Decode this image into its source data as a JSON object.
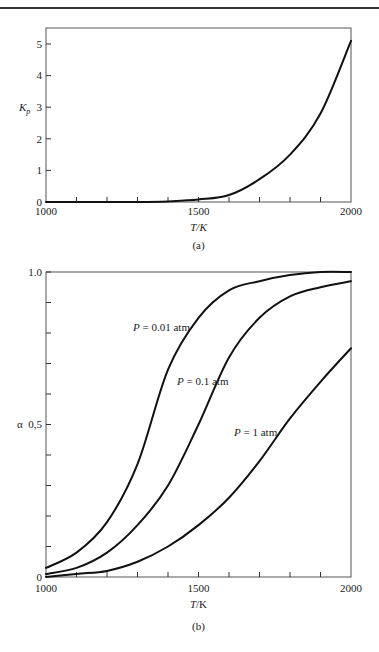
{
  "chart_data": [
    {
      "type": "line",
      "panel": "(a)",
      "title": "",
      "xlabel": "T/K",
      "ylabel": "Kp",
      "xlim": [
        1000,
        2000
      ],
      "ylim": [
        0,
        5.4
      ],
      "x_ticks": [
        1000,
        1100,
        1200,
        1300,
        1400,
        1500,
        1600,
        1700,
        1800,
        1900,
        2000
      ],
      "x_tick_labels": [
        "1000",
        "1500",
        "2000"
      ],
      "y_ticks": [
        0,
        1,
        2,
        3,
        4,
        5
      ],
      "y_tick_labels": [
        "0",
        "1",
        "2",
        "3",
        "4",
        "5"
      ],
      "grid": false,
      "legend": null,
      "x": [
        1000,
        1100,
        1200,
        1300,
        1400,
        1500,
        1600,
        1700,
        1800,
        1900,
        2000
      ],
      "series": [
        {
          "name": "Kp",
          "values": [
            0.0,
            0.0,
            0.0,
            0.0,
            0.02,
            0.08,
            0.22,
            0.72,
            1.5,
            2.8,
            5.1
          ]
        }
      ]
    },
    {
      "type": "line",
      "panel": "(b)",
      "title": "",
      "xlabel": "T/K",
      "ylabel": "α",
      "xlim": [
        1000,
        2000
      ],
      "ylim": [
        0,
        1.0
      ],
      "x_ticks": [
        1000,
        1100,
        1200,
        1300,
        1400,
        1500,
        1600,
        1700,
        1800,
        1900,
        2000
      ],
      "x_tick_labels": [
        "1000",
        "1500",
        "2000"
      ],
      "y_ticks": [
        0,
        0.1,
        0.2,
        0.3,
        0.4,
        0.5,
        0.6,
        0.7,
        0.8,
        0.9,
        1.0
      ],
      "y_tick_labels": [
        "0",
        "0,5",
        "1.0"
      ],
      "grid": false,
      "legend": "inline labels",
      "x": [
        1000,
        1100,
        1200,
        1300,
        1400,
        1500,
        1600,
        1700,
        1800,
        1900,
        2000
      ],
      "series": [
        {
          "name": "P = 0.01 atm",
          "values": [
            0.03,
            0.08,
            0.18,
            0.37,
            0.68,
            0.85,
            0.94,
            0.97,
            0.99,
            1.0,
            1.0
          ]
        },
        {
          "name": "P = 0.1 atm",
          "values": [
            0.01,
            0.03,
            0.08,
            0.17,
            0.3,
            0.5,
            0.72,
            0.85,
            0.92,
            0.95,
            0.97
          ]
        },
        {
          "name": "P = 1 atm",
          "values": [
            0.0,
            0.01,
            0.02,
            0.05,
            0.1,
            0.17,
            0.26,
            0.38,
            0.52,
            0.64,
            0.75
          ]
        }
      ]
    }
  ],
  "panels": {
    "a": {
      "caption": "(a)",
      "xlabel": "T/K",
      "ylabel_main": "K",
      "ylabel_sub": "p",
      "x_tick_labels": [
        "1000",
        "1500",
        "2000"
      ],
      "y_tick_labels": [
        "0",
        "1",
        "2",
        "3",
        "4",
        "5"
      ]
    },
    "b": {
      "caption": "(b)",
      "xlabel_italic": "T",
      "xlabel_rest": "/K",
      "ylabel": "α",
      "x_tick_labels": [
        "1000",
        "1500",
        "2000"
      ],
      "y_tick_labels": [
        "0",
        "0,5",
        "1.0"
      ],
      "series_labels": [
        {
          "italic": "P",
          "rest": " = 0.01 atm"
        },
        {
          "italic": "P",
          "rest": " = 0.1 atm"
        },
        {
          "italic": "P",
          "rest": " = 1 atm"
        }
      ]
    }
  }
}
